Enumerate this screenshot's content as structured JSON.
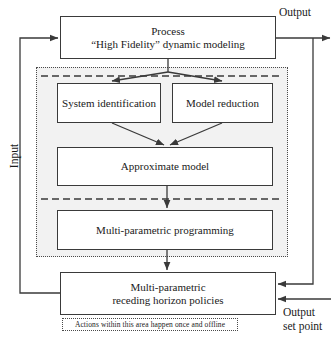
{
  "diagram": {
    "colors": {
      "stroke": "#3a3a3a",
      "dotted_border": "#4a4a4a",
      "shaded_region": "#f2f2f2",
      "background": "#ffffff"
    },
    "boxes": {
      "process": {
        "line1": "Process",
        "line2": "“High Fidelity” dynamic modeling"
      },
      "system_identification": {
        "label": "System identification"
      },
      "model_reduction": {
        "label": "Model reduction"
      },
      "approximate_model": {
        "label": "Approximate model"
      },
      "multi_parametric_programming": {
        "label": "Multi-parametric programming"
      },
      "multi_parametric_policies": {
        "line1": "Multi-parametric",
        "line2": "receding horizon policies"
      }
    },
    "labels": {
      "output_top": "Output",
      "input_left": "Input",
      "output_set_point_line1": "Output",
      "output_set_point_line2": "set point"
    },
    "annotations": {
      "offline_caption": "Actions within this area happen once and offline"
    }
  }
}
